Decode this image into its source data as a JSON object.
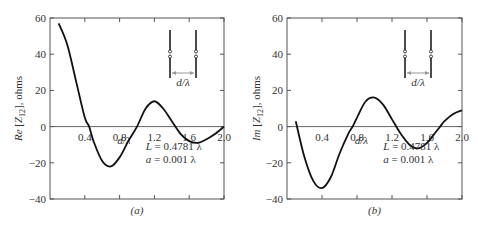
{
  "chart_data": [
    {
      "type": "line",
      "panel_label": "(a)",
      "title": "",
      "xlabel": "d/λ",
      "ylabel": "Re [Z12], ohms",
      "ylabel_parts": {
        "prefix": "Re",
        "bracket": "[Z",
        "sub": "12",
        "suffix": "], ohms"
      },
      "xlim": [
        0,
        2.0
      ],
      "ylim": [
        -40,
        60
      ],
      "x_ticks": [
        "0.4",
        "0.8",
        "1.2",
        "1.6",
        "2.0"
      ],
      "y_ticks": [
        "60",
        "40",
        "20",
        "0",
        "-20",
        "-40"
      ],
      "grid": false,
      "annotations": [
        "L = 0.4781 λ",
        "a = 0.001 λ"
      ],
      "inset_label": "d/λ",
      "series": [
        {
          "name": "Re[Z12]",
          "x": [
            0.1,
            0.2,
            0.3,
            0.4,
            0.45,
            0.5,
            0.6,
            0.7,
            0.8,
            0.9,
            1.0,
            1.1,
            1.2,
            1.3,
            1.4,
            1.5,
            1.6,
            1.7,
            1.8,
            1.9,
            2.0
          ],
          "values": [
            57,
            45,
            25,
            5,
            0,
            -8,
            -19,
            -22,
            -17,
            -8,
            0,
            10,
            14,
            10,
            3,
            -4,
            -8,
            -9,
            -7,
            -4,
            0
          ]
        }
      ]
    },
    {
      "type": "line",
      "panel_label": "(b)",
      "title": "",
      "xlabel": "d/λ",
      "ylabel": "Im [Z12], ohms",
      "ylabel_parts": {
        "prefix": "Im",
        "bracket": "[Z",
        "sub": "12",
        "suffix": "], ohms"
      },
      "xlim": [
        0,
        2.0
      ],
      "ylim": [
        -40,
        60
      ],
      "x_ticks": [
        "0.4",
        "0.8",
        "1.2",
        "1.6",
        "2.0"
      ],
      "y_ticks": [
        "60",
        "40",
        "20",
        "0",
        "-20",
        "-40"
      ],
      "grid": false,
      "annotations": [
        "L = 0.4781 λ",
        "a = 0.001 λ"
      ],
      "inset_label": "d/λ",
      "series": [
        {
          "name": "Im[Z12]",
          "x": [
            0.1,
            0.2,
            0.3,
            0.4,
            0.5,
            0.6,
            0.7,
            0.75,
            0.8,
            0.9,
            1.0,
            1.1,
            1.2,
            1.3,
            1.4,
            1.5,
            1.6,
            1.7,
            1.75,
            1.8,
            1.9,
            2.0
          ],
          "values": [
            3,
            -17,
            -30,
            -34,
            -28,
            -15,
            -4,
            0,
            5,
            14,
            16,
            12,
            4,
            -4,
            -10,
            -12,
            -9,
            -3,
            0,
            3,
            7,
            9
          ]
        }
      ]
    }
  ]
}
